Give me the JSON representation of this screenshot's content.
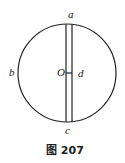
{
  "figure": {
    "caption": "图 207",
    "labels": {
      "a": "a",
      "b": "b",
      "c": "c",
      "d": "d",
      "O": "O"
    },
    "colors": {
      "stroke": "#222222",
      "background": "#ffffff"
    }
  }
}
